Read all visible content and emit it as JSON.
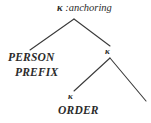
{
  "figure": {
    "name": "syntactic-tree-anchoring",
    "type": "tree-diagram",
    "background_color": "#ffffff",
    "line_color": "#3a3a3a",
    "text_color": "#2b2b2b"
  },
  "tree": {
    "root": {
      "kappa_glyph": "κ",
      "separator": " :",
      "feature": "anchoring",
      "full_label": "κ :anchoring"
    },
    "nodes": {
      "person": "PERSON",
      "prefix": "PREFIX",
      "kappa_mid": "κ",
      "kappa_low": "κ",
      "order": "ORDER"
    }
  },
  "edges": [
    {
      "name": "root-to-left",
      "x1": 74,
      "y1": 19,
      "x2": 30,
      "y2": 50
    },
    {
      "name": "root-to-right",
      "x1": 74,
      "y1": 19,
      "x2": 110,
      "y2": 46
    },
    {
      "name": "mid-to-left",
      "x1": 110,
      "y1": 58,
      "x2": 74,
      "y2": 91
    },
    {
      "name": "mid-to-right",
      "x1": 110,
      "y1": 58,
      "x2": 146,
      "y2": 101
    }
  ]
}
